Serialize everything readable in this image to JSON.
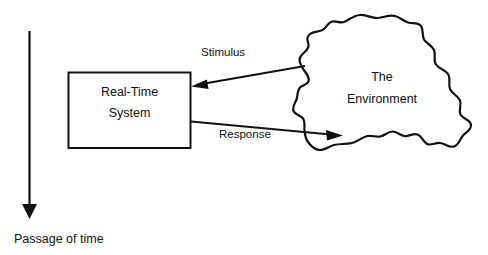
{
  "diagram": {
    "background_color": "#ffffff",
    "stroke_color": "#111111",
    "text_color": "#111111",
    "system_box": {
      "label_line1": "Real-Time",
      "label_line2": "System",
      "x": 68,
      "y": 72,
      "width": 123,
      "height": 76
    },
    "environment": {
      "label_line1": "The",
      "label_line2": "Environment",
      "shape": "cloud"
    },
    "arrows": [
      {
        "name": "stimulus-arrow",
        "label": "Stimulus",
        "direction": "environment-to-system"
      },
      {
        "name": "response-arrow",
        "label": "Response",
        "direction": "system-to-environment"
      },
      {
        "name": "time-arrow",
        "label": "Passage of time",
        "direction": "downward"
      }
    ],
    "timeline": {
      "label": "Passage of time"
    }
  }
}
